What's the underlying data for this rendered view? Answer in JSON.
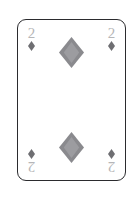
{
  "card": {
    "name": "two-of-diamonds",
    "rank": "2",
    "suit": "diamonds",
    "suit_symbol": "♦",
    "face_color": "#ffffff",
    "border_color": "#2b2b2e",
    "rank_text_color": "#b6b6b8",
    "corner_pip_color": "#6e6e72",
    "center_pip_color": "#8a8a8e",
    "center_pip_shade_color": "#9c9ca0",
    "background_color": "#ffffff",
    "corners": [
      {
        "position": "top-left",
        "rank": "2",
        "suit_symbol": "♦",
        "rotated": false
      },
      {
        "position": "top-right",
        "rank": "2",
        "suit_symbol": "♦",
        "rotated": false
      },
      {
        "position": "bottom-left",
        "rank": "2",
        "suit_symbol": "♦",
        "rotated": true
      },
      {
        "position": "bottom-right",
        "rank": "2",
        "suit_symbol": "♦",
        "rotated": true
      }
    ],
    "center_pips": [
      {
        "position": "top",
        "suit_symbol": "♦"
      },
      {
        "position": "bottom",
        "suit_symbol": "♦"
      }
    ]
  }
}
